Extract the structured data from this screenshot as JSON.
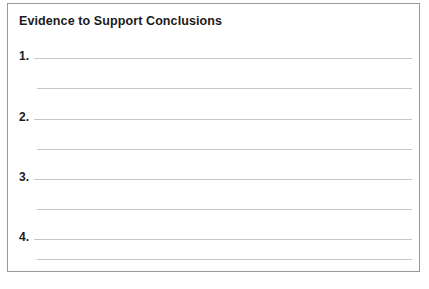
{
  "document": {
    "type": "worksheet",
    "title": "Evidence to Support Conclusions",
    "border_color": "#9a9a9a",
    "rule_color": "#c6c6c6",
    "text_color": "#1b1b1b",
    "background": "#ffffff"
  },
  "items": [
    {
      "number": "1.",
      "lines": [
        "",
        ""
      ]
    },
    {
      "number": "2.",
      "lines": [
        "",
        ""
      ]
    },
    {
      "number": "3.",
      "lines": [
        "",
        ""
      ]
    },
    {
      "number": "4.",
      "lines": [
        "",
        ""
      ]
    }
  ]
}
